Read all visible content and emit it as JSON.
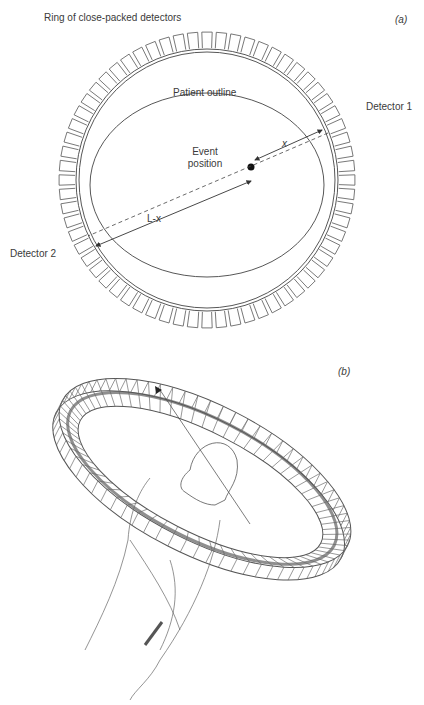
{
  "panel_a": {
    "tag": "(a)",
    "title": "Ring of close-packed detectors",
    "patient_outline_label": "Patient outline",
    "event_label_line1": "Event",
    "event_label_line2": "position",
    "detector1_label": "Detector 1",
    "detector2_label": "Detector 2",
    "distance_x_label": "x",
    "distance_lx_label": "L-x",
    "detector_count": 64
  },
  "panel_b": {
    "tag": "(b)"
  }
}
